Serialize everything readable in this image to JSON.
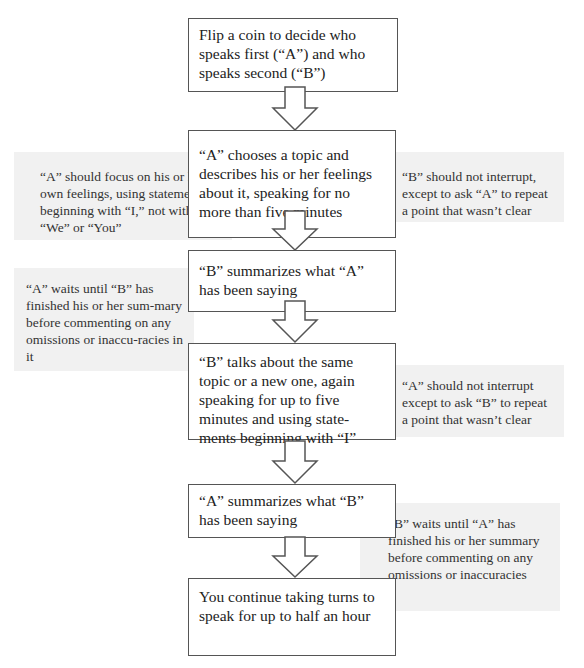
{
  "diagram": {
    "type": "flowchart",
    "steps": [
      {
        "text": "Flip a coin to decide who speaks first (“A”) and who speaks second (“B”)"
      },
      {
        "text": "“A” chooses a topic and describes his or her feelings about it, speaking for no more than five minutes"
      },
      {
        "text": "“B” summarizes what “A” has been saying"
      },
      {
        "text": "“B” talks about the same topic or a new one, again speaking for up to five minutes and using state-ments beginning with “I”"
      },
      {
        "text": "“A” summarizes what “B” has been saying"
      },
      {
        "text": "You continue taking turns to speak for up to half an hour"
      }
    ],
    "notes": [
      {
        "side": "left",
        "text": "“A” should focus on his or her own feelings, using statements beginning with “I,” not with “We” or “You”"
      },
      {
        "side": "right",
        "text": "“B” should not interrupt, except to ask “A” to repeat a point that wasn’t clear"
      },
      {
        "side": "left",
        "text": "“A” waits until “B” has finished  his or her sum-mary before commenting on any omissions or inaccu-racies in it"
      },
      {
        "side": "right",
        "text": "“A” should not interrupt except  to ask “B” to repeat a point that wasn’t clear"
      },
      {
        "side": "right",
        "text": "“B” waits until “A” has finished  his or her summary before commenting on any omissions or inaccuracies"
      }
    ]
  }
}
